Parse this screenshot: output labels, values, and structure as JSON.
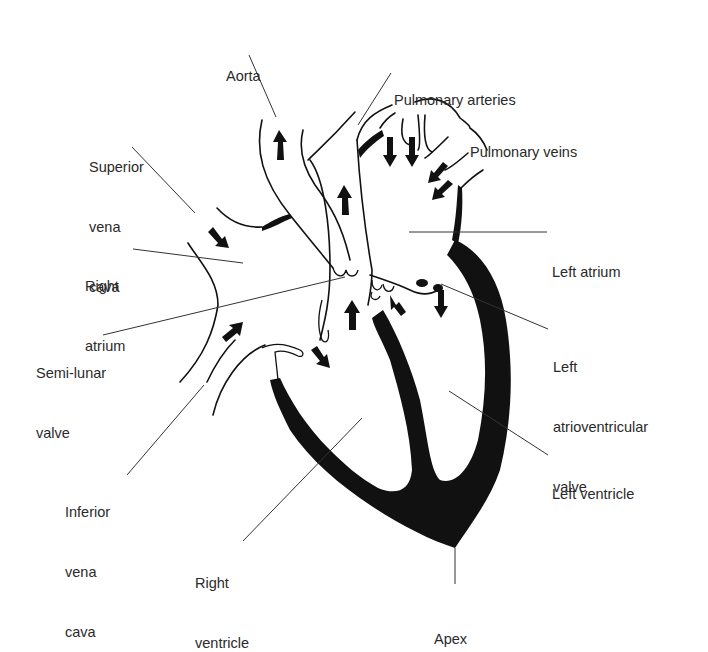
{
  "diagram": {
    "colors": {
      "ink": "#111111",
      "label": "#2a2a2a",
      "leader": "#333333",
      "background": "#ffffff"
    },
    "labels": [
      {
        "id": "aorta",
        "lines": [
          "Aorta"
        ],
        "x": 226,
        "y": 29
      },
      {
        "id": "pulmonary-arteries",
        "lines": [
          "Pulmonary arteries"
        ],
        "x": 394,
        "y": 52
      },
      {
        "id": "pulmonary-veins",
        "lines": [
          "Pulmonary veins"
        ],
        "x": 469,
        "y": 104
      },
      {
        "id": "superior-vena-cava",
        "lines": [
          "Superior",
          "vena",
          "cava"
        ],
        "x": 89,
        "y": 119
      },
      {
        "id": "right-atrium",
        "lines": [
          "Right",
          "atrium"
        ],
        "x": 85,
        "y": 237
      },
      {
        "id": "left-atrium",
        "lines": [
          "Left atrium"
        ],
        "x": 552,
        "y": 223
      },
      {
        "id": "semi-lunar-valve",
        "lines": [
          "Semi-lunar",
          "valve"
        ],
        "x": 36,
        "y": 324
      },
      {
        "id": "left-atrioventricular-valve",
        "lines": [
          "Left",
          "atrioventricular",
          "valve"
        ],
        "x": 553,
        "y": 318
      },
      {
        "id": "left-ventricle",
        "lines": [
          "Left ventricle"
        ],
        "x": 552,
        "y": 444
      },
      {
        "id": "inferior-vena-cava",
        "lines": [
          "Inferior",
          "vena",
          "cava"
        ],
        "x": 65,
        "y": 463
      },
      {
        "id": "right-ventricle",
        "lines": [
          "Right",
          "ventricle"
        ],
        "x": 195,
        "y": 533
      },
      {
        "id": "apex",
        "lines": [
          "Apex"
        ],
        "x": 433,
        "y": 589
      }
    ]
  }
}
